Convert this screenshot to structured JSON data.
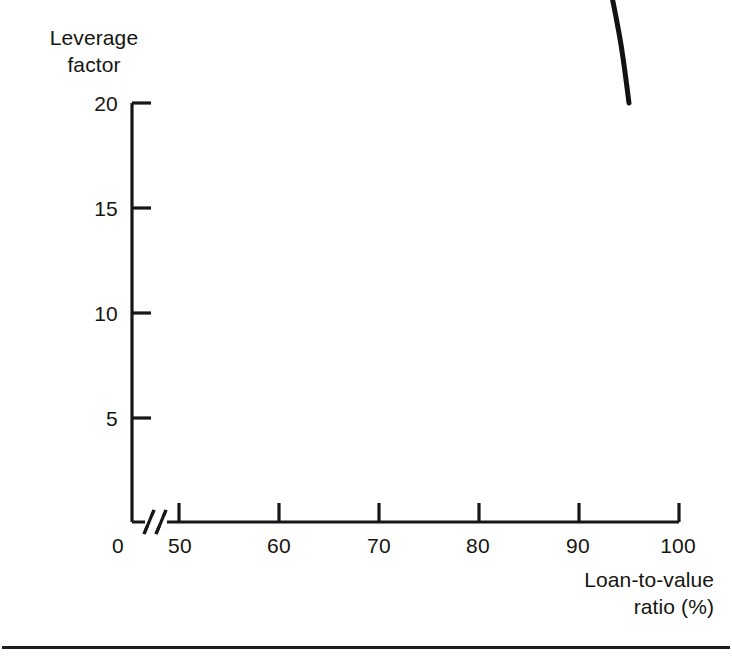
{
  "chart_data": {
    "type": "line",
    "title": "",
    "subtitle": "",
    "xlabel": "Loan-to-value\nratio (%)",
    "ylabel": "Leverage\nfactor",
    "xlabel_line1": "Loan-to-value",
    "xlabel_line2": "ratio (%)",
    "ylabel_line1": "Leverage",
    "ylabel_line2": "factor",
    "xlim": [
      50,
      100
    ],
    "ylim": [
      0,
      20
    ],
    "x_tick_labels": [
      "0",
      "50",
      "60",
      "70",
      "80",
      "90",
      "100"
    ],
    "x_tick_values": [
      0,
      50,
      60,
      70,
      80,
      90,
      100
    ],
    "y_tick_labels": [
      "5",
      "10",
      "15",
      "20"
    ],
    "y_tick_values": [
      5,
      10,
      15,
      20
    ],
    "axis_break": true,
    "axis_break_note": "x-axis break between 0 and 50",
    "grid": false,
    "legend": "none",
    "series": [
      {
        "name": "Leverage factor",
        "formula": "1 / (1 - LTV)",
        "x": [
          50,
          55,
          60,
          65,
          70,
          75,
          80,
          82,
          85,
          87,
          89,
          90,
          91,
          92,
          93,
          94,
          94.5,
          95
        ],
        "values": [
          2.0,
          2.22,
          2.5,
          2.86,
          3.33,
          4.0,
          5.0,
          5.56,
          6.67,
          7.69,
          9.09,
          10.0,
          11.11,
          12.5,
          14.29,
          16.67,
          18.18,
          20.0
        ]
      }
    ],
    "line_color": "#121212",
    "line_width": 5,
    "annotations": []
  },
  "figure": {
    "background_color": "#ffffff",
    "rule_color": "#1d1d1d"
  }
}
